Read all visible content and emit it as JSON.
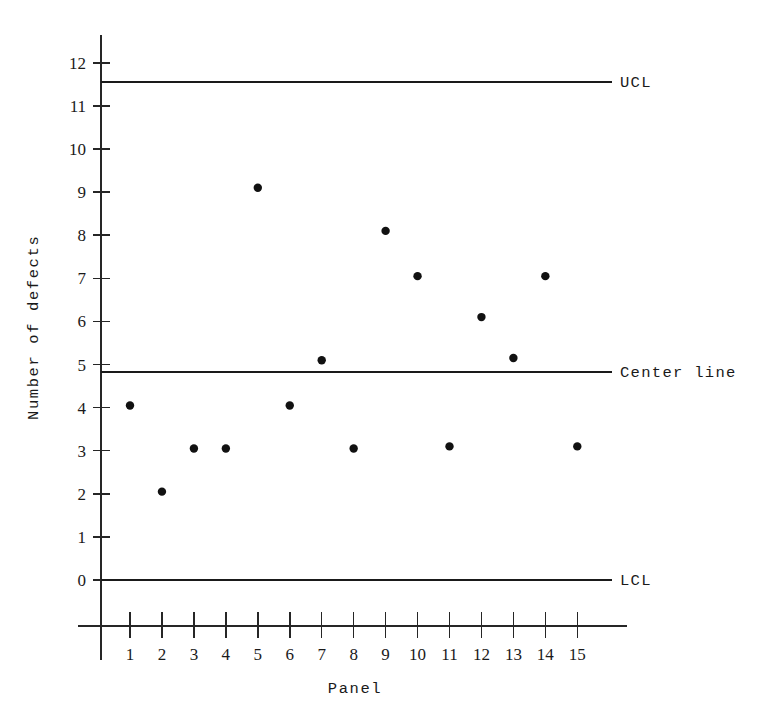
{
  "chart_data": {
    "type": "scatter",
    "title": "",
    "subtitle": "",
    "xlabel": "Panel",
    "ylabel": "Number of defects",
    "x": [
      1,
      2,
      3,
      4,
      5,
      6,
      7,
      8,
      9,
      10,
      11,
      12,
      13,
      14,
      15
    ],
    "values": [
      4.05,
      2.05,
      3.05,
      3.05,
      9.1,
      4.05,
      5.1,
      3.05,
      8.1,
      7.05,
      3.1,
      6.1,
      5.15,
      7.05,
      3.1
    ],
    "series": [
      {
        "name": "Number of defects",
        "values": [
          4.05,
          2.05,
          3.05,
          3.05,
          9.1,
          4.05,
          5.1,
          3.05,
          8.1,
          7.05,
          3.1,
          6.1,
          5.15,
          7.05,
          3.1
        ]
      }
    ],
    "xlim": [
      0,
      16
    ],
    "ylim": [
      0,
      12.6
    ],
    "x_ticks": [
      "1",
      "2",
      "3",
      "4",
      "5",
      "6",
      "7",
      "8",
      "9",
      "10",
      "11",
      "12",
      "13",
      "14",
      "15"
    ],
    "y_ticks": [
      "0",
      "1",
      "2",
      "3",
      "4",
      "5",
      "6",
      "7",
      "8",
      "9",
      "10",
      "11",
      "12"
    ],
    "grid": false,
    "legend_position": "right-inline",
    "control_limits": [
      {
        "key": "ucl",
        "label": "UCL",
        "value": 11.56
      },
      {
        "key": "center",
        "label": "Center line",
        "value": 4.83
      },
      {
        "key": "lcl",
        "label": "LCL",
        "value": 0.0
      }
    ],
    "colors": {
      "point": "#111111",
      "line": "#1a1a1a",
      "axis": "#262626",
      "background": "#ffffff"
    }
  },
  "labels": {
    "y_axis_title": "Number of defects",
    "x_axis_title": "Panel",
    "ucl": "UCL",
    "center_line": "Center line",
    "lcl": "LCL"
  }
}
